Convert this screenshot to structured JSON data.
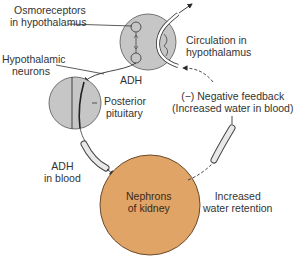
{
  "diagram": {
    "colors": {
      "gland_fill": "#c6c6c6",
      "kidney_fill": "#e0a467",
      "stroke": "#3a3a3a",
      "background": "#ffffff"
    },
    "labels": {
      "osmoreceptors_line1": "Osmoreceptors",
      "osmoreceptors_line2": "in hypothalamus",
      "hypothalamic_line1": "Hypothalamic",
      "hypothalamic_line2": "neurons",
      "adh": "ADH",
      "circulation_line1": "Circulation in",
      "circulation_line2": "hypothalamus",
      "posterior_line1": "Posterior",
      "posterior_line2": "pituitary",
      "feedback_line1": "(−) Negative feedback",
      "feedback_line2": "(Increased water in blood)",
      "adh_blood_line1": "ADH",
      "adh_blood_line2": "in blood",
      "kidney_line1": "Nephrons",
      "kidney_line2": "of kidney",
      "retention_line1": "Increased",
      "retention_line2": "water retention"
    },
    "nodes": [
      {
        "id": "hypothalamus",
        "shape": "circle",
        "fill": "gland_fill"
      },
      {
        "id": "posterior-pituitary",
        "shape": "circle",
        "fill": "gland_fill"
      },
      {
        "id": "kidney-nephrons",
        "shape": "circle",
        "fill": "kidney_fill"
      }
    ],
    "edges": [
      {
        "from": "hypothalamus",
        "to": "posterior-pituitary",
        "label": "ADH"
      },
      {
        "from": "posterior-pituitary",
        "to": "kidney-nephrons",
        "label": "ADH in blood"
      },
      {
        "from": "kidney-nephrons",
        "to": "hypothalamus",
        "label": "(−) Negative feedback (Increased water in blood)",
        "style": "dashed"
      }
    ]
  }
}
